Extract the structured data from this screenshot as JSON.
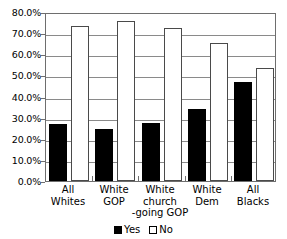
{
  "chart_data": {
    "type": "bar",
    "title": "",
    "xlabel": "",
    "ylabel": "",
    "ylim": [
      0,
      80
    ],
    "grid": true,
    "legend_position": "bottom",
    "categories": [
      "All Whites",
      "White GOP",
      "White church-going GOP",
      "White Dem",
      "All Blacks"
    ],
    "category_lines": [
      [
        "All",
        "Whites"
      ],
      [
        "White",
        "GOP"
      ],
      [
        "White",
        "church",
        "-going GOP"
      ],
      [
        "White",
        "Dem"
      ],
      [
        "All",
        "Blacks"
      ]
    ],
    "series": [
      {
        "name": "Yes",
        "values": [
          27.1,
          24.6,
          27.6,
          34.3,
          46.7
        ],
        "color": "#000000"
      },
      {
        "name": "No",
        "values": [
          73.5,
          75.6,
          72.5,
          65.5,
          53.3
        ],
        "color": "#ffffff"
      }
    ],
    "y_ticks": [
      {
        "value": 0,
        "label": "0.0%"
      },
      {
        "value": 10,
        "label": "10.0%"
      },
      {
        "value": 20,
        "label": "20.0%"
      },
      {
        "value": 30,
        "label": "30.0%"
      },
      {
        "value": 40,
        "label": "40.0%"
      },
      {
        "value": 50,
        "label": "50.0%"
      },
      {
        "value": 60,
        "label": "60.0%"
      },
      {
        "value": 70,
        "label": "70.0%"
      },
      {
        "value": 80,
        "label": "80.0%"
      }
    ],
    "legend": [
      {
        "label": "Yes",
        "swatch": "filled-black-square"
      },
      {
        "label": "No",
        "swatch": "outlined-white-square"
      }
    ]
  }
}
